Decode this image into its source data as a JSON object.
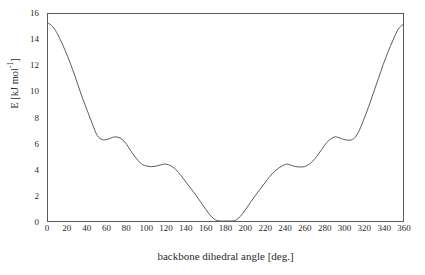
{
  "chart_data": {
    "type": "line",
    "title": "",
    "subtitle": "",
    "xlabel": "backbone dihedral angle [deg.]",
    "ylabel": "E [kJ mol-1]",
    "ylabel_base": "E [kJ mol",
    "ylabel_exp": "-1",
    "ylabel_tail": "]",
    "xlim": [
      0,
      360
    ],
    "ylim": [
      0,
      16
    ],
    "grid": false,
    "legend": "none",
    "line_color": "#4a4a4a",
    "line_width": 0.9,
    "background_color": "#ffffff",
    "frame_color": "#5a5a5a",
    "xticks": [
      0,
      20,
      40,
      60,
      80,
      100,
      120,
      140,
      160,
      180,
      200,
      220,
      240,
      260,
      280,
      300,
      320,
      340,
      360
    ],
    "xtick_labels": [
      "0",
      "20",
      "40",
      "60",
      "80",
      "100",
      "120",
      "140",
      "160",
      "180",
      "200",
      "220",
      "240",
      "260",
      "280",
      "300",
      "320",
      "340",
      "360"
    ],
    "yticks": [
      0,
      2,
      4,
      6,
      8,
      10,
      12,
      14,
      16
    ],
    "ytick_labels": [
      "0",
      "2",
      "4",
      "6",
      "8",
      "10",
      "12",
      "14",
      "16"
    ],
    "series": [
      {
        "name": "torsional energy profile",
        "x": [
          0,
          5,
          10,
          15,
          20,
          25,
          30,
          35,
          40,
          45,
          50,
          55,
          60,
          65,
          68,
          72,
          76,
          80,
          85,
          90,
          95,
          100,
          105,
          110,
          115,
          118,
          122,
          126,
          130,
          135,
          140,
          145,
          150,
          155,
          160,
          165,
          170,
          175,
          180,
          185,
          190,
          195,
          200,
          205,
          210,
          215,
          220,
          225,
          230,
          235,
          240,
          242,
          245,
          250,
          255,
          260,
          265,
          270,
          275,
          280,
          285,
          290,
          292,
          296,
          300,
          305,
          310,
          315,
          320,
          325,
          330,
          335,
          340,
          345,
          350,
          355,
          360
        ],
        "y": [
          15.3,
          15.0,
          14.4,
          13.6,
          12.7,
          11.7,
          10.6,
          9.5,
          8.5,
          7.5,
          6.6,
          6.3,
          6.3,
          6.45,
          6.5,
          6.45,
          6.25,
          5.9,
          5.3,
          4.8,
          4.4,
          4.25,
          4.2,
          4.25,
          4.35,
          4.4,
          4.35,
          4.2,
          3.95,
          3.5,
          3.0,
          2.5,
          2.0,
          1.45,
          0.9,
          0.4,
          0.08,
          0.0,
          0.0,
          0.0,
          0.05,
          0.35,
          0.85,
          1.4,
          1.95,
          2.45,
          2.95,
          3.45,
          3.85,
          4.15,
          4.35,
          4.4,
          4.35,
          4.22,
          4.18,
          4.2,
          4.4,
          4.75,
          5.25,
          5.8,
          6.25,
          6.48,
          6.5,
          6.42,
          6.3,
          6.25,
          6.35,
          6.9,
          7.8,
          8.8,
          9.9,
          11.0,
          12.1,
          13.1,
          14.0,
          14.8,
          15.2
        ]
      }
    ],
    "annotations": []
  }
}
